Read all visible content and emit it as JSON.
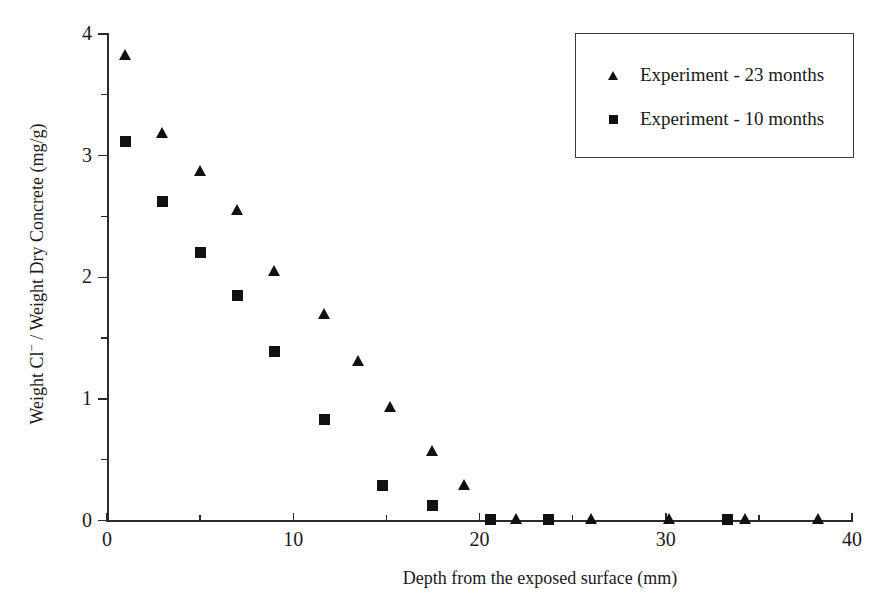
{
  "chart_data": {
    "type": "scatter",
    "title": "",
    "xlabel": "Depth from the exposed surface (mm)",
    "ylabel": "Weight Cl⁻ / Weight Dry Concrete (mg/g)",
    "ylabel_parts": {
      "pre": "Weight Cl",
      "sup": "−",
      "post": " / Weight Dry Concrete (mg/g)"
    },
    "xlim": [
      0,
      40
    ],
    "ylim": [
      0,
      4
    ],
    "xticks": [
      0,
      10,
      20,
      30,
      40
    ],
    "xtick_labels": [
      "0",
      "10",
      "20",
      "30",
      "40"
    ],
    "xticks_minor": [
      5,
      15,
      25,
      35
    ],
    "yticks": [
      0,
      1,
      2,
      3,
      4
    ],
    "ytick_labels": [
      "0",
      "1",
      "2",
      "3",
      "4"
    ],
    "yticks_minor": [
      0.5,
      1.5,
      2.5,
      3.5
    ],
    "grid": false,
    "legend_position": "top-right",
    "series": [
      {
        "name": "Experiment - 23 months",
        "marker": "triangle",
        "color": "#111111",
        "points": [
          [
            1.0,
            3.83
          ],
          [
            3.0,
            3.19
          ],
          [
            5.0,
            2.87
          ],
          [
            7.0,
            2.55
          ],
          [
            9.0,
            2.05
          ],
          [
            11.7,
            1.7
          ],
          [
            13.5,
            1.31
          ],
          [
            15.2,
            0.93
          ],
          [
            17.5,
            0.57
          ],
          [
            19.2,
            0.29
          ],
          [
            22.0,
            0.01
          ],
          [
            26.0,
            0.01
          ],
          [
            30.2,
            0.01
          ],
          [
            34.3,
            0.01
          ],
          [
            38.2,
            0.01
          ]
        ]
      },
      {
        "name": "Experiment - 10 months",
        "marker": "square",
        "color": "#111111",
        "points": [
          [
            1.0,
            3.12
          ],
          [
            3.0,
            2.62
          ],
          [
            5.0,
            2.2
          ],
          [
            7.0,
            1.85
          ],
          [
            9.0,
            1.39
          ],
          [
            11.7,
            0.83
          ],
          [
            14.8,
            0.29
          ],
          [
            17.5,
            0.12
          ],
          [
            20.6,
            0.01
          ],
          [
            23.7,
            0.01
          ],
          [
            33.3,
            0.01
          ]
        ]
      }
    ]
  },
  "legend": {
    "items": [
      {
        "marker": "triangle",
        "label": "Experiment - 23 months"
      },
      {
        "marker": "square",
        "label": "Experiment - 10 months"
      }
    ]
  },
  "colors": {
    "marker": "#111111",
    "axis": "#2b2b2b",
    "legend_border": "#3a3a3a",
    "background": "#ffffff"
  }
}
